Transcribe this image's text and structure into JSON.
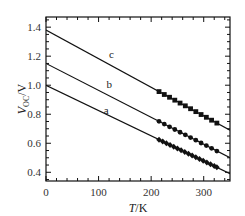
{
  "chart_data": {
    "type": "line",
    "title": "",
    "xlabel": "T/K",
    "ylabel": "V_OC/V",
    "xlim": [
      0,
      350
    ],
    "ylim": [
      0.34,
      1.47
    ],
    "xticks": [
      0,
      100,
      200,
      300
    ],
    "xtick_labels": [
      "0",
      "100",
      "200",
      "300"
    ],
    "yticks": [
      0.4,
      0.6,
      0.8,
      1.0,
      1.2,
      1.4
    ],
    "ytick_labels": [
      "0.4",
      "0.6",
      "0.8",
      "1.0",
      "1.2",
      "1.4"
    ],
    "grid": false,
    "legend": "none; curves labeled inline a, b, c",
    "series": [
      {
        "name": "a",
        "label_pos": {
          "x": 110,
          "y": 0.8
        },
        "line": {
          "x": [
            0,
            350
          ],
          "y": [
            1.0,
            0.39
          ]
        },
        "marker": "diamond",
        "points": {
          "x": [
            215,
            222,
            229,
            236,
            243,
            250,
            257,
            264,
            271,
            278,
            285,
            292,
            299,
            306,
            313,
            320,
            325
          ],
          "y": [
            0.625,
            0.613,
            0.6,
            0.588,
            0.576,
            0.564,
            0.552,
            0.54,
            0.528,
            0.516,
            0.503,
            0.491,
            0.479,
            0.467,
            0.455,
            0.443,
            0.434
          ]
        }
      },
      {
        "name": "b",
        "label_pos": {
          "x": 115,
          "y": 0.98
        },
        "line": {
          "x": [
            0,
            350
          ],
          "y": [
            1.15,
            0.5
          ]
        },
        "marker": "circle",
        "points": {
          "x": [
            215,
            225,
            235,
            245,
            255,
            265,
            275,
            285,
            295,
            305,
            315,
            325
          ],
          "y": [
            0.751,
            0.732,
            0.713,
            0.695,
            0.676,
            0.658,
            0.639,
            0.621,
            0.602,
            0.584,
            0.565,
            0.546
          ]
        }
      },
      {
        "name": "c",
        "label_pos": {
          "x": 120,
          "y": 1.19
        },
        "line": {
          "x": [
            0,
            350
          ],
          "y": [
            1.38,
            0.69
          ]
        },
        "marker": "square",
        "points": {
          "x": [
            215,
            225,
            235,
            245,
            255,
            265,
            275,
            285,
            295,
            305,
            315,
            325
          ],
          "y": [
            0.956,
            0.936,
            0.917,
            0.897,
            0.877,
            0.858,
            0.838,
            0.818,
            0.798,
            0.779,
            0.759,
            0.739
          ]
        }
      }
    ]
  },
  "axes": {
    "xlabel_italic": "T",
    "xlabel_unit": "/K",
    "ylabel_main": "V",
    "ylabel_sub": "OC",
    "ylabel_unit": "/V"
  }
}
